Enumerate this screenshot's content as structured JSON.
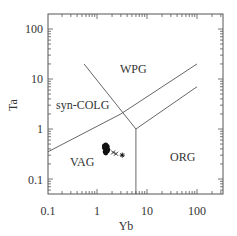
{
  "chart_data": {
    "type": "scatter",
    "title": "",
    "xlabel": "Yb",
    "ylabel": "Ta",
    "xscale": "log",
    "yscale": "log",
    "xlim": [
      0.1,
      330
    ],
    "ylim": [
      0.05,
      200
    ],
    "x_ticks": [
      "0.1",
      "1",
      "10",
      "100"
    ],
    "y_ticks": [
      "100",
      "10",
      "1",
      "0.1"
    ],
    "grid": false,
    "regions": [
      {
        "label": "WPG",
        "x": 3.2,
        "y": 12
      },
      {
        "label": "syn-COLG",
        "x": 0.38,
        "y": 3.1
      },
      {
        "label": "VAG",
        "x": 0.45,
        "y": 0.23
      },
      {
        "label": "ORG",
        "x": 22,
        "y": 0.28
      }
    ],
    "boundaries": [
      {
        "name": "syn-COLG/WPG",
        "points": [
          [
            0.55,
            20
          ],
          [
            6,
            1
          ]
        ]
      },
      {
        "name": "VAG-syn-COLG/WPG-ORG upper",
        "points": [
          [
            0.1,
            0.35
          ],
          [
            3,
            2
          ],
          [
            100,
            20
          ]
        ]
      },
      {
        "name": "WPG/ORG lower",
        "points": [
          [
            6,
            1
          ],
          [
            100,
            7
          ]
        ]
      },
      {
        "name": "VAG/ORG vertical",
        "points": [
          [
            6,
            1
          ],
          [
            6,
            0.05
          ]
        ]
      }
    ],
    "series": [
      {
        "name": "cluster (filled)",
        "marker": "filled-circle",
        "points": [
          [
            1.4,
            0.42
          ],
          [
            1.5,
            0.38
          ],
          [
            1.6,
            0.45
          ],
          [
            1.5,
            0.48
          ],
          [
            1.45,
            0.35
          ],
          [
            1.55,
            0.41
          ],
          [
            1.65,
            0.39
          ],
          [
            1.5,
            0.33
          ],
          [
            1.4,
            0.46
          ],
          [
            1.6,
            0.36
          ]
        ]
      },
      {
        "name": "crosses",
        "marker": "x",
        "points": [
          [
            2.1,
            0.34
          ],
          [
            2.4,
            0.32
          ]
        ]
      },
      {
        "name": "asterisk",
        "marker": "asterisk",
        "points": [
          [
            3.2,
            0.3
          ]
        ]
      }
    ]
  }
}
